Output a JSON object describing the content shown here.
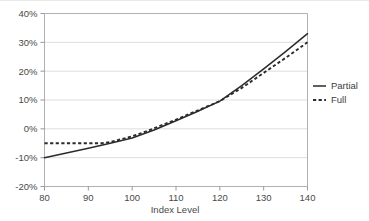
{
  "chart_data": {
    "type": "line",
    "title": "",
    "xlabel": "Index Level",
    "ylabel": "",
    "xlim": [
      80,
      140
    ],
    "ylim": [
      -20,
      40
    ],
    "xticks": [
      80,
      90,
      100,
      110,
      120,
      130,
      140
    ],
    "xtick_labels": [
      "80",
      "90",
      "100",
      "110",
      "120",
      "130",
      "140"
    ],
    "yticks": [
      -20,
      -10,
      0,
      10,
      20,
      30,
      40
    ],
    "ytick_labels": [
      "-20%",
      "-10%",
      "0%",
      "10%",
      "20%",
      "30%",
      "40%"
    ],
    "grid": "horizontal",
    "legend_position": "right-outside",
    "series": [
      {
        "name": "Partial",
        "style": "solid",
        "color": "#2b2b2b",
        "x": [
          80,
          85,
          90,
          95,
          100,
          105,
          110,
          115,
          120,
          125,
          130,
          135,
          140
        ],
        "values": [
          -10.0,
          -8.4,
          -6.7,
          -5.0,
          -3.2,
          -0.4,
          2.8,
          6.1,
          9.6,
          15.0,
          20.8,
          26.8,
          33.0
        ]
      },
      {
        "name": "Full",
        "style": "dashed",
        "color": "#2b2b2b",
        "x": [
          80,
          85,
          90,
          93,
          95,
          97,
          100,
          103,
          105,
          110,
          115,
          120,
          125,
          130,
          135,
          140
        ],
        "values": [
          -5.0,
          -5.0,
          -5.0,
          -5.0,
          -4.6,
          -3.8,
          -2.6,
          -1.0,
          0.2,
          3.2,
          6.4,
          9.6,
          14.2,
          19.4,
          24.6,
          30.0
        ]
      }
    ]
  },
  "legend": {
    "entries": [
      {
        "label": "Partial",
        "style": "solid"
      },
      {
        "label": "Full",
        "style": "dashed"
      }
    ]
  },
  "axes": {
    "x_title": "Index Level"
  }
}
